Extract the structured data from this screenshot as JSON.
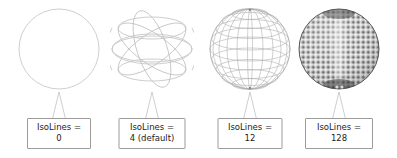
{
  "figure": {
    "background_color": "#ffffff",
    "box_border_color": "#9b9b9b",
    "text_color": "#1b1b1b",
    "wire_color": "#b7b7b7",
    "dense_color": "#5a5a5a"
  },
  "panels": [
    {
      "label_line1": "IsoLines =",
      "label_line2": "0",
      "isolines": 0,
      "sphere_style": "outline-only",
      "meridians": 0,
      "latitudes": 0,
      "box_width": 64,
      "center_x": 59
    },
    {
      "label_line1": "IsoLines =",
      "label_line2": "4 (default)",
      "isolines": 4,
      "sphere_style": "wireframe-sparse",
      "meridians": 4,
      "latitudes": 3,
      "box_width": 67,
      "center_x": 152
    },
    {
      "label_line1": "IsoLines =",
      "label_line2": "12",
      "isolines": 12,
      "sphere_style": "wireframe-medium",
      "meridians": 12,
      "latitudes": 11,
      "box_width": 65,
      "center_x": 250
    },
    {
      "label_line1": "IsoLines =",
      "label_line2": "128",
      "isolines": 128,
      "sphere_style": "wireframe-dense",
      "meridians": 128,
      "latitudes": 127,
      "box_width": 68,
      "center_x": 338
    }
  ]
}
